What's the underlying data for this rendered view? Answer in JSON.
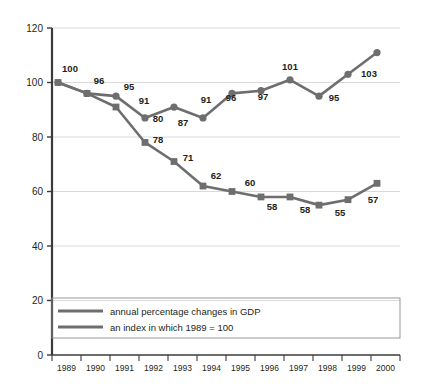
{
  "chart_data": {
    "type": "line",
    "title": "",
    "subtitle": "",
    "xlabel": "",
    "ylabel": "",
    "ylim": [
      0,
      120
    ],
    "yticks": [
      0,
      20,
      40,
      60,
      80,
      100,
      120
    ],
    "grid": true,
    "legend_position": "bottom-left",
    "categories": [
      "1989",
      "1990",
      "1991",
      "1992",
      "1993",
      "1994",
      "1995",
      "1996",
      "1997",
      "1998",
      "1999",
      "2000"
    ],
    "series": [
      {
        "name": "an index in which 1989 = 100",
        "marker": "circle",
        "color": "#6e6e6e",
        "values": [
          100,
          96,
          95,
          87,
          91,
          87,
          96,
          97,
          101,
          95,
          103,
          111
        ],
        "labels": [
          "100",
          "96",
          "95",
          "91",
          "91",
          "87",
          "96",
          "97",
          "101",
          "95",
          "103",
          ""
        ]
      },
      {
        "name": "annual percentage changes in GDP",
        "marker": "square",
        "color": "#6e6e6e",
        "values": [
          100,
          96,
          91,
          78,
          71,
          62,
          60,
          58,
          58,
          55,
          57,
          63
        ],
        "labels": [
          "",
          "",
          "",
          "80",
          "78",
          "71",
          "62",
          "60",
          "58",
          "58",
          "55",
          "57"
        ]
      }
    ]
  },
  "legend": {
    "items": [
      {
        "label": "annual percentage changes in GDP",
        "color": "#6e6e6e"
      },
      {
        "label": "an index in which 1989 = 100",
        "color": "#6e6e6e"
      }
    ]
  },
  "axes": {
    "y_ticks": [
      "0",
      "20",
      "40",
      "60",
      "80",
      "100",
      "120"
    ],
    "x_ticks": [
      "1989",
      "1990",
      "1991",
      "1992",
      "1993",
      "1994",
      "1995",
      "1996",
      "1997",
      "1998",
      "1999",
      "2000"
    ]
  },
  "point_labels": {
    "index_series": [
      {
        "text": "100",
        "x": 70,
        "y": 72
      },
      {
        "text": "96",
        "x": 99,
        "y": 84
      },
      {
        "text": "95",
        "x": 129,
        "y": 90
      },
      {
        "text": "91",
        "x": 144,
        "y": 104
      },
      {
        "text": "91",
        "x": 206,
        "y": 103
      },
      {
        "text": "87",
        "x": 183,
        "y": 126
      },
      {
        "text": "96",
        "x": 231,
        "y": 101
      },
      {
        "text": "97",
        "x": 263,
        "y": 100
      },
      {
        "text": "101",
        "x": 290,
        "y": 70
      },
      {
        "text": "95",
        "x": 334,
        "y": 101
      },
      {
        "text": "103",
        "x": 369,
        "y": 77
      }
    ],
    "gdp_series": [
      {
        "text": "80",
        "x": 158,
        "y": 122
      },
      {
        "text": "78",
        "x": 158,
        "y": 143
      },
      {
        "text": "71",
        "x": 188,
        "y": 161
      },
      {
        "text": "62",
        "x": 216,
        "y": 179
      },
      {
        "text": "60",
        "x": 250,
        "y": 186
      },
      {
        "text": "58",
        "x": 272,
        "y": 210
      },
      {
        "text": "58",
        "x": 305,
        "y": 213
      },
      {
        "text": "55",
        "x": 340,
        "y": 216
      },
      {
        "text": "57",
        "x": 373,
        "y": 203
      }
    ]
  },
  "colors": {
    "line": "#6e6e6e",
    "marker": "#6e6e6e",
    "grid": "#d9d9d9",
    "axis": "#3b3b3b",
    "text": "#231f20",
    "legend_border": "#8c8c8c",
    "background": "#ffffff"
  }
}
